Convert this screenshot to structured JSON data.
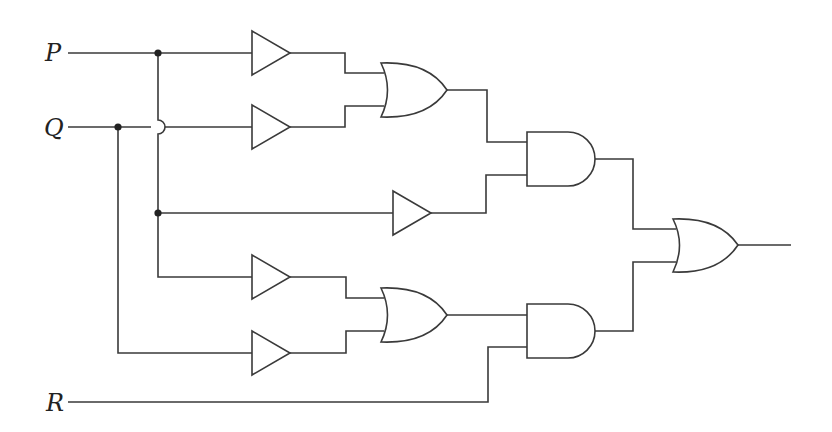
{
  "diagram": {
    "type": "logic-circuit",
    "inputs": [
      {
        "name": "P",
        "label": "P",
        "y": 53
      },
      {
        "name": "Q",
        "label": "Q",
        "y": 127
      },
      {
        "name": "R",
        "label": "R",
        "y": 402
      }
    ],
    "gates": [
      {
        "id": "buf1",
        "type": "buffer",
        "input": "P"
      },
      {
        "id": "buf2",
        "type": "buffer",
        "input": "Q"
      },
      {
        "id": "or1",
        "type": "OR",
        "inputs": [
          "buf1",
          "buf2"
        ]
      },
      {
        "id": "buf3",
        "type": "buffer",
        "input": "P"
      },
      {
        "id": "and1",
        "type": "AND",
        "inputs": [
          "or1",
          "buf3"
        ]
      },
      {
        "id": "buf4",
        "type": "buffer",
        "input": "P"
      },
      {
        "id": "buf5",
        "type": "buffer",
        "input": "Q"
      },
      {
        "id": "or2",
        "type": "OR",
        "inputs": [
          "buf4",
          "buf5"
        ]
      },
      {
        "id": "and2",
        "type": "AND",
        "inputs": [
          "or2",
          "R"
        ]
      },
      {
        "id": "or3",
        "type": "OR",
        "inputs": [
          "and1",
          "and2"
        ]
      }
    ],
    "output": {
      "source": "or3",
      "label": ""
    },
    "colors": {
      "line": "#3a3a3a",
      "background": "#ffffff",
      "junction": "#222222"
    }
  }
}
